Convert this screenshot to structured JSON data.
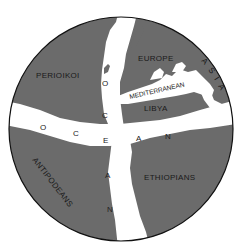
{
  "map": {
    "colors": {
      "land": "#6b6b6b",
      "ocean": "#ffffff",
      "border": "#111111",
      "label": "#1a1a1a"
    },
    "regions": {
      "perioikoi": "PERIOIKOI",
      "europe": "EUROPE",
      "asia": [
        "A",
        "S",
        "I",
        "A"
      ],
      "libya": "LIBYA",
      "antipodeans": "ANTIPODEANS",
      "ethiopians": "ETHIOPIANS"
    },
    "seas": {
      "mediterranean": "MEDITERRANEAN"
    },
    "ocean_vertical": [
      "O",
      "C",
      "E",
      "A",
      "N"
    ],
    "ocean_horizontal": [
      "O",
      "C",
      "E",
      "A",
      "N"
    ]
  }
}
